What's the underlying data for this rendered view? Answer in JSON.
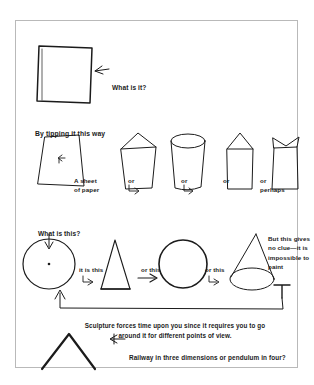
{
  "figure": {
    "annotations": {
      "what_is_it": "What is it?",
      "by_tipping": "By tipping it this way",
      "a_sheet_of_paper": "A sheet\nof paper",
      "or_1": "or",
      "or_2": "or",
      "or_3": "or",
      "or_perhaps": "or\nperhaps",
      "what_is_this": "What is this?",
      "it_is_this": "it is this",
      "or_this_1": "or this",
      "or_this_2": "or this",
      "but_this_gives_no_clue": "But this gives no clue—it is impossible to paint",
      "sculpture_caption": "Sculpture forces time upon you since it requires you to go around it for different points of view.",
      "railway_caption": "Railway in three dimensions or pendulum in four?"
    },
    "shapes": {
      "rectangle": "upright rectangle sheet",
      "tipped_sheet": "tipped trapezoid sheet",
      "tapered_box": "tapered box with slanted top",
      "cylinder": "cylinder with elliptical top",
      "pointed_box": "box with pointed roof",
      "notched_vessel": "vessel with notched flared top",
      "circle_with_dot": "circle with center dot",
      "triangle": "tall triangle",
      "disc": "filled outline circle",
      "cone": "cone with elliptical base",
      "chevron": "inverted V pendulum"
    },
    "colors": {
      "ink": "#1b1b1b",
      "frame": "#b9b9b9",
      "paper": "#ffffff"
    }
  }
}
